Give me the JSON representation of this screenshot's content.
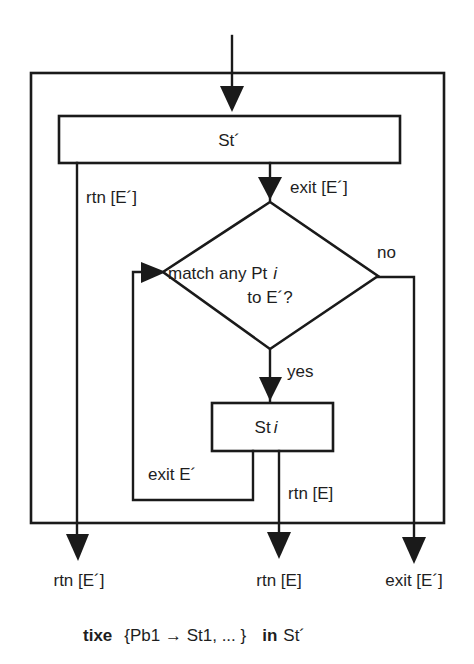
{
  "diagram": {
    "outer_block": {
      "label": ""
    },
    "st_prime_box": {
      "label": "St´"
    },
    "decision": {
      "line1": "match any Pt",
      "line1_var": "i",
      "line2": "to E´?"
    },
    "st_i_box": {
      "label": "St",
      "label_var": "i"
    },
    "edge_labels": {
      "st_prime_rtn": "rtn [E´]",
      "st_prime_exit": "exit [E´]",
      "decision_no": "no",
      "decision_yes": "yes",
      "st_i_exit": "exit E´",
      "st_i_rtn": "rtn [E]"
    },
    "outputs": {
      "left": "rtn [E´]",
      "middle": "rtn [E]",
      "right": "exit [E´]"
    },
    "caption": {
      "keyword_tixe": "tixe",
      "body": "{Pb1 → St1, ... }",
      "keyword_in": "in",
      "target": "St´"
    },
    "colors": {
      "stroke": "#1a1a1a",
      "background": "#ffffff"
    }
  }
}
